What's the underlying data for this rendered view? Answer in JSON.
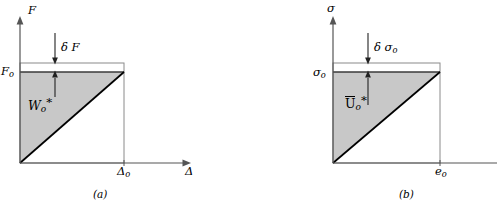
{
  "figure": {
    "background": "#ffffff",
    "line_color": "#000000",
    "fill_color": "#c8c8c8",
    "panels": [
      {
        "id": "a",
        "caption": "(a)",
        "y_axis_label": "F",
        "x_axis_label": "Δ",
        "y_value_label": "F",
        "y_value_sub": "o",
        "x_value_label": "Δ",
        "x_value_sub": "o",
        "increment_label": "δ F",
        "area_label": "W",
        "area_sub": "o",
        "area_star": "*",
        "area_overline": false
      },
      {
        "id": "b",
        "caption": "(b)",
        "y_axis_label": "σ",
        "x_axis_label": "",
        "y_value_label": "σ",
        "y_value_sub": "o",
        "x_value_label": "e",
        "x_value_sub": "o",
        "increment_label": "δ σ",
        "increment_sub": "o",
        "area_label": "U",
        "area_sub": "o",
        "area_star": "*",
        "area_overline": true
      }
    ]
  }
}
